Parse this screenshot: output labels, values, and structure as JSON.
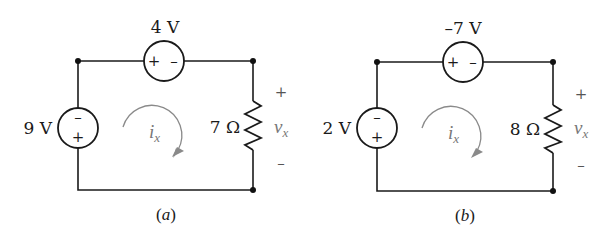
{
  "figure": {
    "circuits": [
      {
        "id": "a",
        "caption": "(a)",
        "top_source": {
          "label": "4 V",
          "plus": "+",
          "minus": "–"
        },
        "left_source": {
          "label": "9 V",
          "plus": "+",
          "minus": "–"
        },
        "resistor": {
          "label": "7 Ω"
        },
        "loop_current": {
          "symbol": "i",
          "subscript": "x"
        },
        "voltage": {
          "symbol": "v",
          "subscript": "x",
          "plus": "+",
          "minus": "–"
        }
      },
      {
        "id": "b",
        "caption": "(b)",
        "top_source": {
          "label": "–7 V",
          "plus": "+",
          "minus": "–"
        },
        "left_source": {
          "label": "2 V",
          "plus": "+",
          "minus": "–"
        },
        "resistor": {
          "label": "8 Ω"
        },
        "loop_current": {
          "symbol": "i",
          "subscript": "x"
        },
        "voltage": {
          "symbol": "v",
          "subscript": "x",
          "plus": "+",
          "minus": "–"
        }
      }
    ]
  }
}
